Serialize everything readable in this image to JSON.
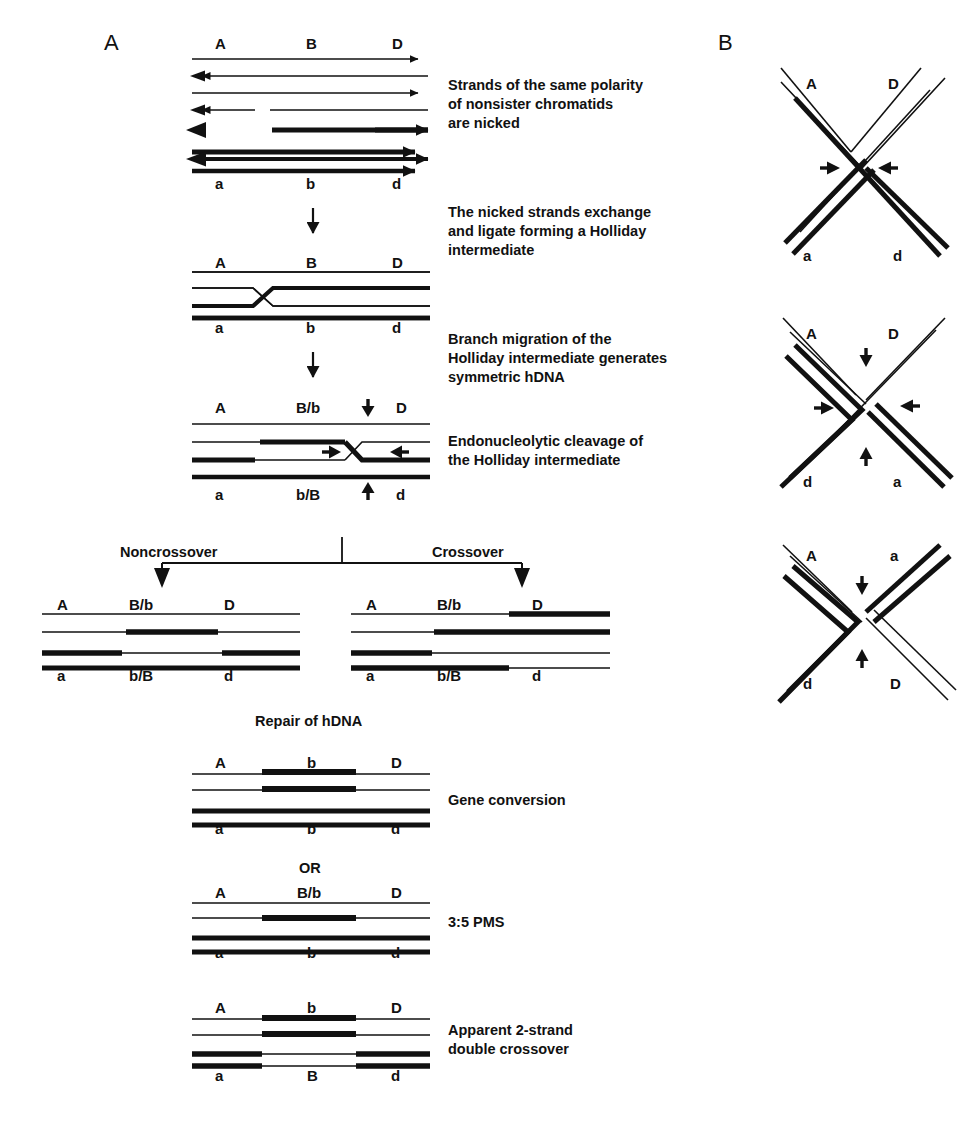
{
  "figure": {
    "panels": [
      {
        "id": "A",
        "letter": "A"
      },
      {
        "id": "B",
        "letter": "B"
      }
    ]
  },
  "panelA": {
    "letter": "A",
    "steps": [
      {
        "id": "nicked-duplexes",
        "top_labels": [
          "A",
          "B",
          "D"
        ],
        "bottom_labels": [
          "a",
          "b",
          "d"
        ],
        "description": "Strands of the same polarity\nof nonsister chromatids\nare nicked",
        "strand_count": 8
      },
      {
        "id": "holliday-intermediate",
        "top_labels": [
          "A",
          "B",
          "D"
        ],
        "bottom_labels": [
          "a",
          "b",
          "d"
        ],
        "description": "The nicked strands exchange\nand ligate forming a Holliday\nintermediate",
        "strand_count": 4
      },
      {
        "id": "branch-migration",
        "top_labels": [
          "A",
          "B/b",
          "D"
        ],
        "bottom_labels": [
          "a",
          "b/B",
          "d"
        ],
        "description": "Branch migration of the\nHolliday intermediate generates\nsymmetric hDNA",
        "strand_count": 4
      },
      {
        "id": "endonucleolytic-cleavage",
        "description": "Endonucleolytic cleavage of\nthe Holliday intermediate",
        "arrow_count": 4
      }
    ],
    "branch": {
      "left_label": "Noncrossover",
      "right_label": "Crossover"
    },
    "outcomes": [
      {
        "id": "noncrossover",
        "top_labels": [
          "A",
          "B/b",
          "D"
        ],
        "bottom_labels": [
          "a",
          "b/B",
          "d"
        ]
      },
      {
        "id": "crossover",
        "top_labels": [
          "A",
          "B/b",
          "D"
        ],
        "bottom_labels": [
          "a",
          "b/B",
          "d"
        ]
      }
    ],
    "repair_caption": "Repair of hDNA",
    "or_label": "OR",
    "results": [
      {
        "id": "gene-conversion",
        "top_labels": [
          "A",
          "b",
          "D"
        ],
        "bottom_labels": [
          "a",
          "b",
          "d"
        ],
        "description": "Gene conversion"
      },
      {
        "id": "pms-3-5",
        "top_labels": [
          "A",
          "B/b",
          "D"
        ],
        "bottom_labels": [
          "a",
          "b",
          "d"
        ],
        "description": "3:5 PMS"
      },
      {
        "id": "apparent-double-crossover",
        "top_labels": [
          "A",
          "b",
          "D"
        ],
        "bottom_labels": [
          "a",
          "B",
          "d"
        ],
        "description": "Apparent 2-strand\ndouble crossover"
      }
    ]
  },
  "panelB": {
    "letter": "B",
    "chi_structures": [
      {
        "id": "chi-1",
        "top_left": "A",
        "top_right": "D",
        "bottom_left": "a",
        "bottom_right": "d",
        "arrows": [
          "left",
          "right"
        ]
      },
      {
        "id": "chi-2",
        "top_left": "A",
        "top_right": "D",
        "bottom_left": "d",
        "bottom_right": "a",
        "arrows": [
          "left",
          "right",
          "up",
          "down"
        ]
      },
      {
        "id": "chi-3",
        "top_left": "A",
        "top_right": "a",
        "bottom_left": "d",
        "bottom_right": "D",
        "arrows": [
          "up",
          "down"
        ]
      }
    ]
  },
  "colors": {
    "ink": "#111111",
    "background": "#ffffff"
  }
}
